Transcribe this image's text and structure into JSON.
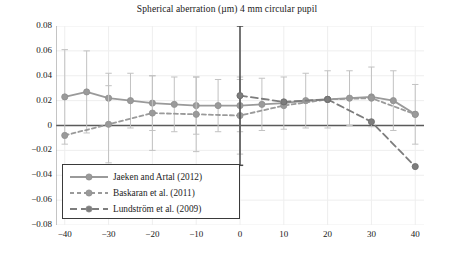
{
  "title": "Spherical aberration (µm) 4 mm circular pupil",
  "axes": {
    "y_ticks": [
      "0.08",
      "0.06",
      "0.04",
      "0.02",
      "0",
      "−0.02",
      "−0.04",
      "−0.06",
      "−0.08"
    ],
    "x_ticks": [
      "−40",
      "−30",
      "−20",
      "−10",
      "0",
      "10",
      "20",
      "30",
      "40"
    ]
  },
  "legend": {
    "items": [
      {
        "label": "Jaeken and Artal (2012)",
        "style": "solid",
        "color": "#9a9a9a"
      },
      {
        "label": "Baskaran et al. (2011)",
        "style": "dashed-short",
        "color": "#9a9a9a"
      },
      {
        "label": "Lundström et al. (2009)",
        "style": "dashed-long",
        "color": "#7d7d7d"
      }
    ]
  },
  "chart_data": {
    "type": "line",
    "title": "Spherical aberration (µm) 4 mm circular pupil",
    "xlabel": "",
    "ylabel": "",
    "xlim": [
      -42,
      42
    ],
    "ylim": [
      -0.08,
      0.08
    ],
    "ytick_step": 0.02,
    "xtick_step": 10,
    "grid": true,
    "legend_position": "lower-left",
    "error_bars": true,
    "series": [
      {
        "name": "Jaeken and Artal (2012)",
        "style": "solid",
        "color": "#9a9a9a",
        "x": [
          -40,
          -35,
          -30,
          -25,
          -20,
          -15,
          -10,
          -5,
          0,
          5,
          10,
          15,
          20,
          25,
          30,
          35,
          40
        ],
        "y": [
          0.023,
          0.027,
          0.022,
          0.02,
          0.018,
          0.017,
          0.016,
          0.016,
          0.016,
          0.017,
          0.018,
          0.02,
          0.021,
          0.022,
          0.023,
          0.02,
          0.009
        ],
        "yerr": [
          0.038,
          0.033,
          0.02,
          0.022,
          0.022,
          0.022,
          0.023,
          0.021,
          0.021,
          0.021,
          0.021,
          0.022,
          0.023,
          0.022,
          0.024,
          0.024,
          0.024
        ]
      },
      {
        "name": "Baskaran et al. (2011)",
        "style": "dashed-short",
        "color": "#9a9a9a",
        "x": [
          -40,
          -30,
          -20,
          -10,
          0,
          10,
          20,
          30,
          40
        ],
        "y": [
          -0.008,
          0.001,
          0.01,
          0.009,
          0.008,
          0.016,
          0.021,
          0.022,
          0.009
        ],
        "yerr": [
          0.0,
          0.031,
          0.03,
          0.03,
          0.031,
          0.0,
          0.0,
          0.0,
          0.0
        ]
      },
      {
        "name": "Lundström et al. (2009)",
        "style": "dashed-long",
        "color": "#7d7d7d",
        "x": [
          0,
          10,
          20,
          30,
          40
        ],
        "y": [
          0.024,
          0.019,
          0.021,
          0.003,
          -0.033
        ],
        "yerr": [
          0.056,
          0.0,
          0.0,
          0.0,
          0.0
        ]
      }
    ]
  }
}
